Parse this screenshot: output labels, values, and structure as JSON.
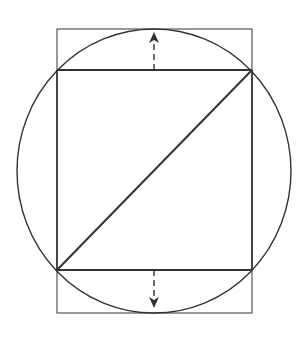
{
  "diagram": {
    "title": "",
    "colors": {
      "stroke": "#333333",
      "outer_rect": "#555555",
      "background": "#ffffff"
    },
    "circle": {
      "cx": 154,
      "cy": 171,
      "rx": 137,
      "ry": 142
    },
    "outer_rect": {
      "x": 57,
      "y": 29,
      "width": 195,
      "height": 284
    },
    "inner_rect": {
      "x": 57,
      "y": 70,
      "width": 195,
      "height": 200
    },
    "diagonal": {
      "x1": 57,
      "y1": 270,
      "x2": 252,
      "y2": 70
    },
    "arrows": [
      {
        "name": "up-arrow",
        "x": 154,
        "from_y": 70,
        "to_y": 34,
        "direction": "up"
      },
      {
        "name": "down-arrow",
        "x": 154,
        "from_y": 270,
        "to_y": 306,
        "direction": "down"
      }
    ]
  }
}
